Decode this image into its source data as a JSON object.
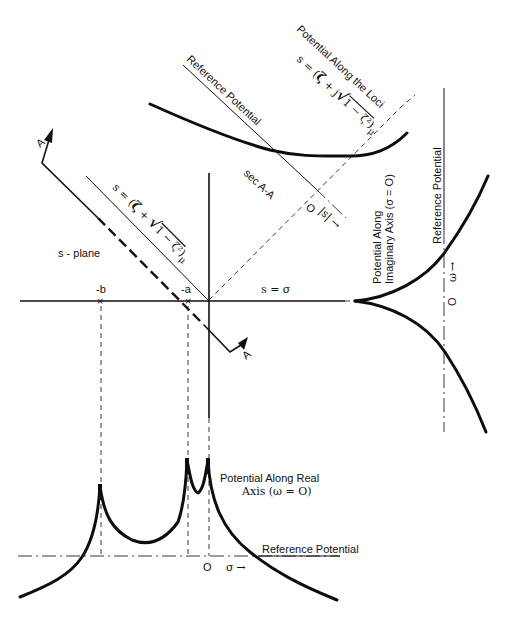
{
  "figure": {
    "top_section": {
      "title": "Potential Along the Loci",
      "formula_lhs": "s = (",
      "formula_zeta": "ζ",
      "formula_plus": " + j",
      "formula_sqrt": "√",
      "formula_radicand": "1 − ζ²",
      "formula_close": ")",
      "formula_subscript": "μ",
      "reference_label": "Reference Potential"
    },
    "s_plane": {
      "label": "s - plane",
      "real_axis_label": "s = σ",
      "pole_b_label": "-b",
      "pole_a_label": "-a",
      "loci_formula_lhs": "s = (",
      "loci_formula_zeta": "ζ",
      "loci_formula_plus": " + ",
      "loci_formula_sqrt": "√",
      "loci_formula_radicand": "1 − ζ²",
      "loci_formula_close": ")",
      "loci_formula_subscript": "μ",
      "section_label": "sec A-A",
      "section_arrow_top": "A",
      "section_arrow_bottom": "A",
      "origin_label": "O",
      "abs_s_label": "|s|",
      "abs_s_arrow": "→"
    },
    "right_section": {
      "title_line1": "Potential Along",
      "title_line2": "Imaginary Axis (σ = O)",
      "reference_label": "Reference Potential",
      "omega_label": "ω",
      "omega_arrow": "→",
      "origin_label": "O"
    },
    "bottom_section": {
      "title_line1": "Potential Along Real",
      "title_line2": "Axis (ω = O)",
      "reference_label": "Reference Potential",
      "origin_label": "O",
      "sigma_label": "σ",
      "sigma_arrow": "→"
    },
    "colors": {
      "ink": "#111111",
      "background": "#ffffff"
    }
  }
}
